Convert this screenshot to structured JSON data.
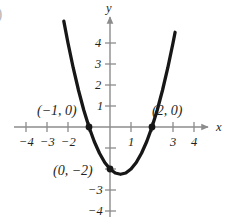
{
  "figure": {
    "corner_mark": ")",
    "axis_color": "#8c8c8c",
    "curve_color": "#171717",
    "text_color": "#231f20"
  },
  "chart_data": {
    "type": "line",
    "title": "",
    "subtitle": "",
    "xlabel": "x",
    "ylabel": "y",
    "equation": "y = x^2 - x - 2",
    "xlim": [
      -4.6,
      4.8
    ],
    "ylim": [
      -4.5,
      5.0
    ],
    "grid": false,
    "legend": null,
    "x_ticks": [
      -4,
      -3,
      -2,
      -1,
      1,
      2,
      3,
      4
    ],
    "x_tick_labels": [
      "-4",
      "-3",
      "-2",
      "",
      "1",
      "",
      "3",
      "4"
    ],
    "y_ticks": [
      -4,
      -3,
      -2,
      -1,
      1,
      2,
      3,
      4
    ],
    "y_tick_labels": [
      "-4",
      "-3",
      "",
      "",
      "1",
      "2",
      "3",
      "4"
    ],
    "series": [
      {
        "name": "parabola",
        "x": [
          -2.2,
          -2.0,
          -1.75,
          -1.5,
          -1.25,
          -1.0,
          -0.75,
          -0.5,
          -0.25,
          0,
          0.25,
          0.5,
          0.75,
          1.0,
          1.25,
          1.5,
          1.75,
          2.0,
          2.25,
          2.5,
          2.75,
          3.0,
          3.1
        ],
        "y": [
          5.04,
          4.0,
          2.81,
          1.75,
          0.81,
          0.0,
          -0.69,
          -1.25,
          -1.69,
          -2.0,
          -2.19,
          -2.25,
          -2.19,
          -2.0,
          -1.69,
          -1.25,
          -0.69,
          0.0,
          0.81,
          1.75,
          2.81,
          4.0,
          4.51
        ]
      }
    ],
    "points": [
      {
        "x": -1,
        "y": 0,
        "label": "(−1, 0)"
      },
      {
        "x": 2,
        "y": 0,
        "label": "(2, 0)"
      },
      {
        "x": 0,
        "y": -2,
        "label": "(0, −2)"
      }
    ],
    "annotations": [
      {
        "text": "(−1, 0)",
        "x": -1,
        "y": 0,
        "anchor": "left-above"
      },
      {
        "text": "(2, 0)",
        "x": 2,
        "y": 0,
        "anchor": "right-above"
      },
      {
        "text": "(0, −2)",
        "x": 0,
        "y": -2,
        "anchor": "left-below"
      }
    ]
  },
  "x_labels": [
    {
      "text": "−4",
      "value": -4
    },
    {
      "text": "−3",
      "value": -3
    },
    {
      "text": "−2",
      "value": -2
    },
    {
      "text": "1",
      "value": 1
    },
    {
      "text": "3",
      "value": 3
    },
    {
      "text": "4",
      "value": 4
    }
  ],
  "y_labels": [
    {
      "text": "4",
      "value": 4
    },
    {
      "text": "3",
      "value": 3
    },
    {
      "text": "2",
      "value": 2
    },
    {
      "text": "1",
      "value": 1
    },
    {
      "text": "−3",
      "value": -3
    },
    {
      "text": "−4",
      "value": -4
    }
  ],
  "axis_names": {
    "x": "x",
    "y": "y"
  },
  "point_labels": {
    "left_root": "(−1, 0)",
    "right_root": "(2, 0)",
    "y_intercept": "(0, −2)"
  }
}
